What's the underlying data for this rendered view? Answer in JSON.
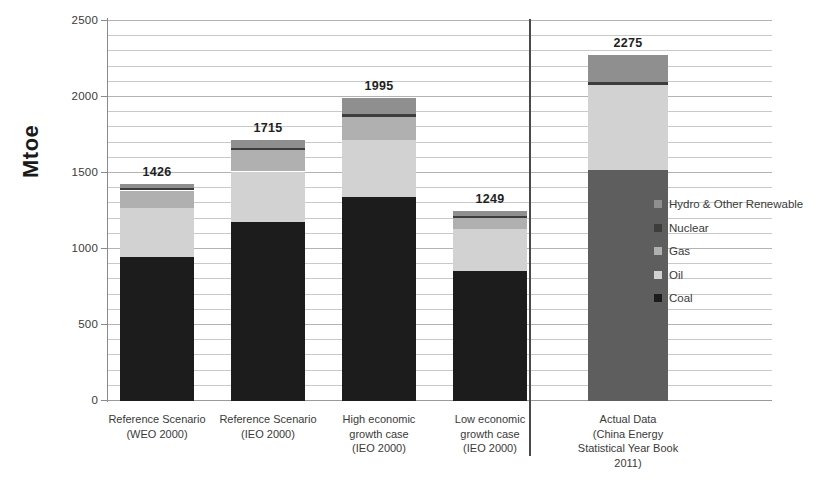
{
  "chart_data": {
    "type": "bar",
    "subtype": "stacked-bar",
    "title": "",
    "xlabel": "",
    "ylabel": "Mtoe",
    "ylim": [
      0,
      2500
    ],
    "yticks": [
      0,
      500,
      1000,
      1500,
      2000,
      2500
    ],
    "ytick_labels": [
      "0",
      "500",
      "1000",
      "1500",
      "2000",
      "2500"
    ],
    "minor_gridline_step": 100,
    "grid": true,
    "legend_position": "right",
    "categories": [
      "Reference Scenario (WEO 2000)",
      "Reference Scenario (IEO 2000)",
      "High economic growth case (IEO 2000)",
      "Low economic growth case (IEO 2000)",
      "Actual Data (China Energy Statistical Year Book 2011)"
    ],
    "category_lines": [
      [
        "Reference Scenario",
        "(WEO 2000)"
      ],
      [
        "Reference Scenario",
        "(IEO 2000)"
      ],
      [
        "High economic",
        "growth case",
        "(IEO 2000)"
      ],
      [
        "Low economic",
        "growth case",
        "(IEO 2000)"
      ],
      [
        "Actual Data",
        "(China Energy",
        "Statistical Year Book",
        "2011)"
      ]
    ],
    "series": [
      {
        "name": "Coal",
        "color": "#1c1c1c",
        "values": [
          945,
          1175,
          1345,
          855,
          1520
        ]
      },
      {
        "name": "Oil",
        "color": "#d2d2d2",
        "values": [
          325,
          335,
          375,
          275,
          560
        ]
      },
      {
        "name": "Gas",
        "color": "#b0b0b0",
        "values": [
          115,
          140,
          150,
          75,
          0
        ]
      },
      {
        "name": "Nuclear",
        "color": "#3d3d3d",
        "values": [
          15,
          15,
          20,
          13,
          20
        ]
      },
      {
        "name": "Hydro & Other Renewable",
        "color": "#8f8f8f",
        "values": [
          26,
          50,
          105,
          31,
          175
        ]
      }
    ],
    "totals": [
      1426,
      1715,
      1995,
      1249,
      2275
    ],
    "total_labels": [
      "1426",
      "1715",
      "1995",
      "1249",
      "2275"
    ],
    "legend_entries": [
      {
        "label": "Hydro & Other Renewable",
        "color": "#8f8f8f"
      },
      {
        "label": "Nuclear",
        "color": "#3d3d3d"
      },
      {
        "label": "Gas",
        "color": "#b0b0b0"
      },
      {
        "label": "Oil",
        "color": "#d2d2d2"
      },
      {
        "label": "Coal",
        "color": "#1c1c1c"
      }
    ],
    "separator_after_category_index": 3,
    "bar_overrides": [
      {
        "index": 4,
        "series": "Coal",
        "color": "#5e5e5e"
      }
    ]
  }
}
